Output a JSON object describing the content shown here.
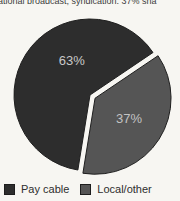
{
  "caption": "ational broadcast, syndication: 37% sha",
  "chart_data": {
    "type": "pie",
    "title": "ational broadcast, syndication: 37% sha",
    "categories": [
      "Pay cable",
      "Local/other"
    ],
    "values": [
      63,
      37
    ],
    "slices": [
      {
        "label": "Pay cable",
        "value": 63,
        "display": "63%",
        "color": "#2d2d2d",
        "label_color": "#c9c9c9",
        "explode": 0
      },
      {
        "label": "Local/other",
        "value": 37,
        "display": "37%",
        "color": "#555555",
        "label_color": "#c3c3c3",
        "explode": 6
      }
    ],
    "start_angle_deg": 260.8,
    "legend_position": "bottom",
    "background": "#f7f6f2"
  }
}
